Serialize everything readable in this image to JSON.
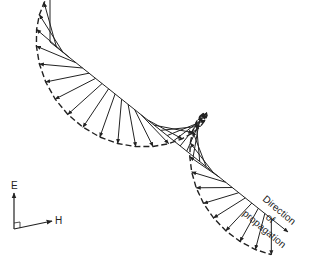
{
  "diagram": {
    "axis_labels": {
      "e": "E",
      "h": "H"
    },
    "propagation_label": {
      "line1": "Direction",
      "line2": "of",
      "line3": "propagation"
    },
    "colors": {
      "ink": "#222222",
      "background": "#ffffff"
    },
    "geometry": {
      "axis_start": [
        50,
        42
      ],
      "axis_end": [
        288,
        232
      ],
      "vector_count": 34,
      "turns": 1.5,
      "radius": 48,
      "e_dir": [
        0,
        -1
      ],
      "h_dir": [
        -0.95,
        0.1
      ]
    }
  }
}
